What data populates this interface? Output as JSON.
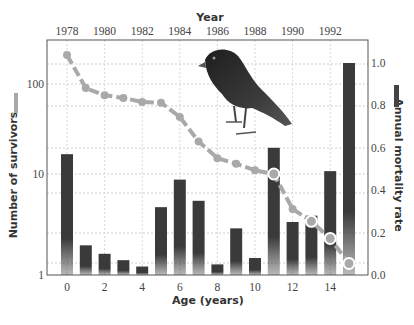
{
  "chart_data": {
    "type": "bar+line",
    "title": "",
    "top_axis": {
      "label": "Year",
      "ticks": [
        "1978",
        "1980",
        "1982",
        "1984",
        "1986",
        "1988",
        "1990",
        "1992"
      ]
    },
    "xlabel": "Age (years)",
    "x_ticks": [
      "0",
      "2",
      "4",
      "6",
      "8",
      "10",
      "12",
      "14"
    ],
    "x": [
      0,
      1,
      2,
      3,
      4,
      5,
      6,
      7,
      8,
      9,
      10,
      11,
      12,
      13,
      14,
      15
    ],
    "y_left": {
      "label": "Number of survivors",
      "scale": "log",
      "ticks": [
        "1",
        "10",
        "100"
      ],
      "range": [
        1,
        300
      ]
    },
    "y_right": {
      "label": "Annual mortality rate",
      "scale": "linear",
      "ticks": [
        "0.0",
        "0.2",
        "0.4",
        "0.6",
        "0.8",
        "1.0"
      ],
      "range": [
        0,
        1.0
      ]
    },
    "series": [
      {
        "name": "Number of survivors",
        "type": "line",
        "axis": "left",
        "color": "#a9a9a9",
        "style": "dashed with circle markers",
        "values": [
          210,
          90,
          75,
          70,
          63,
          62,
          43,
          23,
          15,
          13,
          11,
          10,
          4.5,
          3.4,
          2.3,
          1.3
        ]
      },
      {
        "name": "Annual mortality rate",
        "type": "bar",
        "axis": "right",
        "color": "#3c3c3c",
        "values": [
          0.57,
          0.14,
          0.1,
          0.07,
          0.04,
          0.32,
          0.45,
          0.35,
          0.05,
          0.22,
          0.08,
          0.6,
          0.25,
          0.28,
          0.49,
          1.0
        ]
      }
    ],
    "grid": true,
    "legend": "inline swatches next to axis titles",
    "illustration": "finch bird perched"
  }
}
